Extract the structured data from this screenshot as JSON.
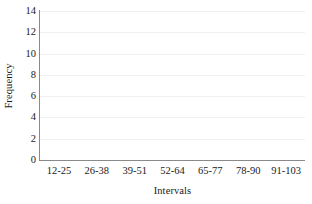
{
  "chart_data": {
    "type": "bar",
    "title": "",
    "xlabel": "Intervals",
    "ylabel": "Frequency",
    "categories": [
      "12-25",
      "26-38",
      "39-51",
      "52-64",
      "65-77",
      "78-90",
      "91-103"
    ],
    "values": [
      0,
      0,
      0,
      0,
      0,
      0,
      0
    ],
    "ylim": [
      0,
      14
    ],
    "ytick_step": 2,
    "yticks": [
      0,
      2,
      4,
      6,
      8,
      10,
      12,
      14
    ],
    "ytick_labels": [
      "0",
      "2",
      "4",
      "6",
      "8",
      "10",
      "12",
      "14"
    ],
    "grid": true,
    "grid_axis": "y",
    "legend": false,
    "legend_position": "none",
    "bars_drawn": false,
    "colors": {
      "background": "#ffffff",
      "axis_line": "#8a8a8a",
      "gridline": "#f0f0f1",
      "text": "#1a1a1a",
      "bar_fill": "#ffffff"
    }
  }
}
